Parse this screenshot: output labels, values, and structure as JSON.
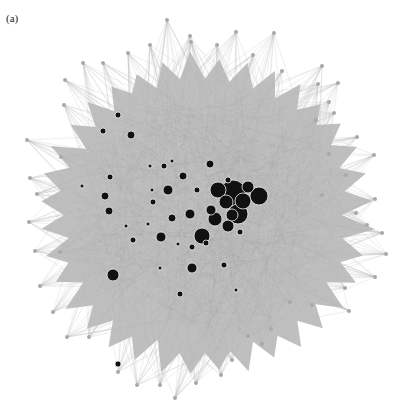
{
  "figure": {
    "panel_label": "(a)",
    "type": "network graph",
    "edge_color": "#bdbdbd",
    "peripheral_node_color": "#a8a8a8",
    "hub_node_color": "#111111",
    "hub_node_stroke": "#f0f0f0"
  },
  "hubs": [
    [
      233,
      193,
      13
    ],
    [
      218,
      190,
      8
    ],
    [
      259,
      196,
      9
    ],
    [
      238,
      214,
      10
    ],
    [
      226,
      202,
      7
    ],
    [
      243,
      201,
      8
    ],
    [
      215,
      219,
      7
    ],
    [
      202,
      236,
      8
    ],
    [
      228,
      226,
      6
    ],
    [
      232,
      215,
      6
    ],
    [
      248,
      187,
      6
    ],
    [
      211,
      210,
      5
    ],
    [
      190,
      214,
      5
    ],
    [
      168,
      190,
      5
    ],
    [
      161,
      237,
      5
    ],
    [
      172,
      218,
      4
    ],
    [
      113,
      275,
      6
    ],
    [
      192,
      268,
      5
    ],
    [
      131,
      135,
      4
    ],
    [
      105,
      196,
      4
    ],
    [
      109,
      211,
      4
    ],
    [
      110,
      177,
      3
    ],
    [
      153,
      202,
      3
    ],
    [
      183,
      176,
      4
    ],
    [
      210,
      164,
      4
    ],
    [
      197,
      190,
      3
    ],
    [
      228,
      180,
      3
    ],
    [
      224,
      265,
      3
    ],
    [
      192,
      247,
      3
    ],
    [
      180,
      294,
      3
    ],
    [
      133,
      240,
      3
    ],
    [
      118,
      364,
      3
    ],
    [
      148,
      224,
      2
    ],
    [
      103,
      131,
      3
    ],
    [
      118,
      115,
      3
    ],
    [
      164,
      166,
      3
    ],
    [
      150,
      166,
      2
    ],
    [
      240,
      232,
      3
    ],
    [
      236,
      290,
      2
    ],
    [
      160,
      268,
      2
    ],
    [
      82,
      186,
      2
    ],
    [
      206,
      243,
      3
    ],
    [
      178,
      244,
      2
    ],
    [
      126,
      226,
      2
    ],
    [
      152,
      190,
      2
    ],
    [
      172,
      161,
      2
    ]
  ],
  "spikes": [
    [
      167,
      20
    ],
    [
      190,
      36
    ],
    [
      236,
      32
    ],
    [
      274,
      33
    ],
    [
      217,
      45
    ],
    [
      191,
      42
    ],
    [
      150,
      45
    ],
    [
      128,
      53
    ],
    [
      103,
      63
    ],
    [
      83,
      63
    ],
    [
      253,
      55
    ],
    [
      322,
      66
    ],
    [
      282,
      71
    ],
    [
      65,
      80
    ],
    [
      64,
      105
    ],
    [
      27,
      140
    ],
    [
      30,
      178
    ],
    [
      37,
      194
    ],
    [
      61,
      157
    ],
    [
      29,
      222
    ],
    [
      35,
      251
    ],
    [
      40,
      286
    ],
    [
      60,
      252
    ],
    [
      53,
      312
    ],
    [
      67,
      337
    ],
    [
      89,
      337
    ],
    [
      118,
      372
    ],
    [
      137,
      385
    ],
    [
      160,
      385
    ],
    [
      175,
      398
    ],
    [
      196,
      383
    ],
    [
      221,
      375
    ],
    [
      232,
      360
    ],
    [
      248,
      336
    ],
    [
      262,
      344
    ],
    [
      271,
      329
    ],
    [
      290,
      302
    ],
    [
      312,
      305
    ],
    [
      349,
      311
    ],
    [
      345,
      288
    ],
    [
      375,
      277
    ],
    [
      386,
      254
    ],
    [
      382,
      233
    ],
    [
      367,
      225
    ],
    [
      356,
      213
    ],
    [
      375,
      199
    ],
    [
      322,
      195
    ],
    [
      346,
      175
    ],
    [
      329,
      154
    ],
    [
      374,
      155
    ],
    [
      357,
      137
    ],
    [
      334,
      113
    ],
    [
      316,
      120
    ],
    [
      329,
      102
    ],
    [
      338,
      83
    ],
    [
      318,
      84
    ]
  ]
}
